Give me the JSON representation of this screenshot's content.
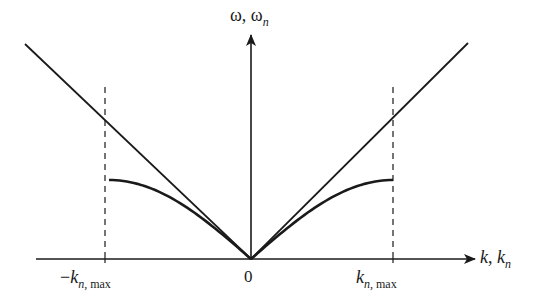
{
  "figure": {
    "type": "dispersion-relation-diagram",
    "y_axis": {
      "label_main": "ω",
      "label_sep": ", ",
      "label_sym": "ω",
      "label_sub": "n"
    },
    "x_axis": {
      "label_main": "k",
      "label_sep": ", ",
      "label_sym": "k",
      "label_sub": "n"
    },
    "ticks": {
      "negative": {
        "prefix": "−",
        "sym": "k",
        "sub_italic": "n",
        "sub_rest": ", max"
      },
      "zero": {
        "label": "0"
      },
      "positive": {
        "sym": "k",
        "sub_italic": "n",
        "sub_rest": ", max"
      }
    },
    "elements": [
      {
        "name": "linear-dispersion",
        "description": "straight lines ω = c|k| through origin",
        "style": "solid"
      },
      {
        "name": "lattice-dispersion",
        "description": "ω_n ∝ |sin(k_n a/2)| curve, flattening at ±k_n,max",
        "style": "solid-bold"
      },
      {
        "name": "brillouin-zone-boundaries",
        "description": "vertical dashed lines at ±k_n,max",
        "style": "dashed"
      }
    ],
    "colors": {
      "line": "#1a1a1a",
      "background": "#ffffff"
    }
  }
}
